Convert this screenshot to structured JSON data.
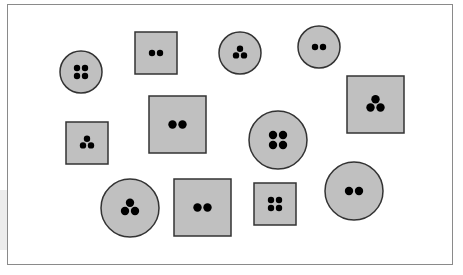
{
  "diagram": {
    "fill_color": "#c0c0c0",
    "stroke_color": "#333333",
    "dot_color": "#000000",
    "frame_color": "#8a8a8a",
    "shapes": [
      {
        "kind": "circle",
        "cx": 81,
        "cy": 72,
        "r": 21,
        "dots": 4
      },
      {
        "kind": "square",
        "x": 135,
        "y": 32,
        "size": 42,
        "dots": 2
      },
      {
        "kind": "circle",
        "cx": 240,
        "cy": 53,
        "r": 21,
        "dots": 3
      },
      {
        "kind": "circle",
        "cx": 319,
        "cy": 47,
        "r": 21,
        "dots": 2
      },
      {
        "kind": "square",
        "x": 347,
        "y": 76,
        "size": 57,
        "dots": 3
      },
      {
        "kind": "square",
        "x": 66,
        "y": 122,
        "size": 42,
        "dots": 3
      },
      {
        "kind": "square",
        "x": 149,
        "y": 96,
        "size": 57,
        "dots": 2
      },
      {
        "kind": "circle",
        "cx": 278,
        "cy": 140,
        "r": 29,
        "dots": 4
      },
      {
        "kind": "circle",
        "cx": 130,
        "cy": 208,
        "r": 29,
        "dots": 3
      },
      {
        "kind": "square",
        "x": 174,
        "y": 179,
        "size": 57,
        "dots": 2
      },
      {
        "kind": "square",
        "x": 254,
        "y": 183,
        "size": 42,
        "dots": 4
      },
      {
        "kind": "circle",
        "cx": 354,
        "cy": 191,
        "r": 29,
        "dots": 2
      }
    ]
  }
}
